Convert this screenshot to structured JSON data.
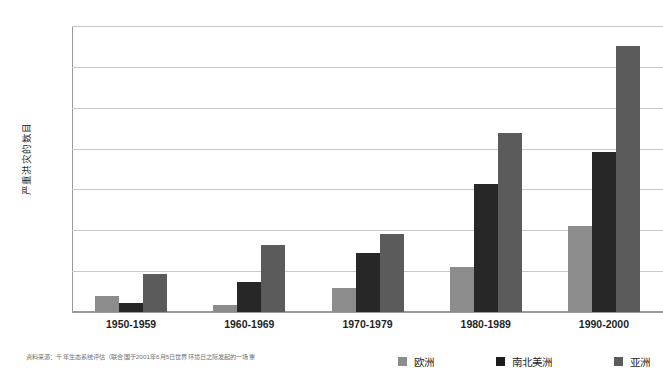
{
  "chart_data": {
    "type": "bar",
    "title": "",
    "xlabel": "",
    "ylabel": "严重洪灾的数目",
    "ylim": [
      0,
      350
    ],
    "ytick_step": 50,
    "yticks": [
      350,
      300,
      250,
      200,
      150,
      100,
      50,
      0
    ],
    "grid": true,
    "legend_position": "bottom-right",
    "categories": [
      "1950-1959",
      "1960-1969",
      "1970-1979",
      "1980-1989",
      "1990-2000"
    ],
    "series": [
      {
        "name": "欧洲",
        "color": "#8c8c8c",
        "values": [
          20,
          9,
          30,
          55,
          105
        ]
      },
      {
        "name": "南北美洲",
        "color": "#1d1d1d",
        "values": [
          11,
          37,
          72,
          157,
          196
        ]
      },
      {
        "name": "亚洲",
        "color": "#5b5b5b",
        "values": [
          46,
          82,
          95,
          219,
          325
        ]
      }
    ]
  },
  "footnote": {
    "text": "资料来源：千年生态系统评估（联合国于2001年6月5日世界环境日之际发起的一场重"
  }
}
